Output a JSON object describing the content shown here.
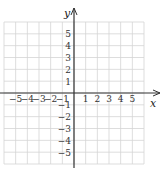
{
  "chart_data": {
    "type": "coordinate-grid",
    "title": "",
    "xlabel": "x",
    "ylabel": "y",
    "xlim": [
      -6,
      6
    ],
    "ylim": [
      -6,
      6
    ],
    "grid": true,
    "x_tick_labels": [
      "-5",
      "-4",
      "-3",
      "-2",
      "-1",
      "1",
      "2",
      "3",
      "4",
      "5"
    ],
    "y_tick_labels": [
      "5",
      "4",
      "3",
      "2",
      "1",
      "-1",
      "-2",
      "-3",
      "-4",
      "-5"
    ],
    "colors": {
      "grid": "#d4d4d4",
      "axis": "#333333"
    }
  },
  "axes": {
    "x_label": "x",
    "y_label": "y"
  }
}
